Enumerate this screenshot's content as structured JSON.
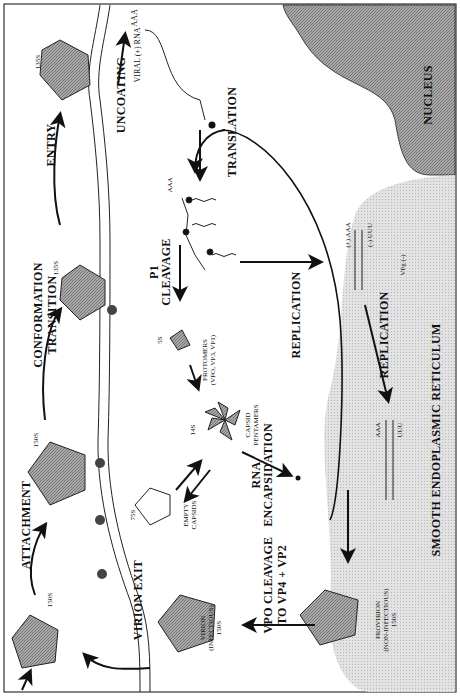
{
  "figure": {
    "orientation": "rotated-90-ccw",
    "regions": {
      "nucleus": "NUCLEUS",
      "er": "SMOOTH ENDOPLASMIC RETICULUM"
    },
    "steps": {
      "attachment": "ATTACHMENT",
      "conformation_1": "CONFORMATION",
      "conformation_2": "TRANSITION",
      "entry": "ENTRY",
      "uncoating": "UNCOATING",
      "translation": "TRANSLATION",
      "p1_1": "P1",
      "p1_2": "CLEAVAGE",
      "replication_1": "REPLICATION",
      "replication_2": "REPLICATION",
      "rna_enc_1": "RNA",
      "rna_enc_2": "ENCAPSIDATION",
      "vpo_1": "VPO CLEAVAGE",
      "vpo_2": "TO VP4 + VP2",
      "virion_exit": "VIRION EXIT"
    },
    "particles": {
      "s150a": "150S",
      "s150b": "150S",
      "s135a": "135S",
      "s135b": "135S",
      "s5": "5S",
      "s14": "14S",
      "s75": "75S",
      "protomers_1": "PROTOMERS",
      "protomers_2": "(VPO, VP3, VP1)",
      "pentamers_1": "CAPSID",
      "pentamers_2": "PENTAMERS",
      "empty_1": "EMPTY",
      "empty_2": "CAPSIDS",
      "virion_1": "VIRION",
      "virion_2": "(INFECTIOUS)",
      "virion_3": "150S",
      "provirion_1": "PROVIRION",
      "provirion_2": "(NON-INFECTIOUS)",
      "provirion_3": "150S"
    },
    "rna": {
      "viral_rna": "VIRAL (+) RNA",
      "aaa1": "AAA",
      "aaa2": "AAA",
      "plus_aaa": "(+) AAA",
      "minus_uuu": "(-) UUU",
      "aaa3": "AAA",
      "uuu": "UUU",
      "vpg": "VPg (-)"
    },
    "colors": {
      "nucleus": "#8f8f8f",
      "er": "#d9d9d9",
      "virion_fill": "#9a9a9a",
      "line": "#111111"
    }
  }
}
